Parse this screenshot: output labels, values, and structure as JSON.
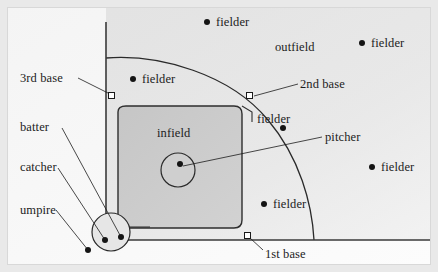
{
  "figure": {
    "background_color": "#fbfbfb",
    "frame_color": "#e9e9e9",
    "ink_color": "#1c1c1c",
    "outfield_fill": "#d9d9d9",
    "infield_fill": "#c9c9c9"
  },
  "region_labels": {
    "outfield": "outfield",
    "infield": "infield"
  },
  "base_labels": {
    "first": "1st base",
    "second": "2nd base",
    "third": "3rd base"
  },
  "player_labels": {
    "pitcher": "pitcher",
    "batter": "batter",
    "catcher": "catcher",
    "umpire": "umpire"
  },
  "fielders": [
    {
      "label": "fielder",
      "dot_x": 207,
      "dot_y": 22,
      "text_x": 216,
      "text_y": 15
    },
    {
      "label": "fielder",
      "dot_x": 362,
      "dot_y": 43,
      "text_x": 371,
      "text_y": 36
    },
    {
      "label": "fielder",
      "dot_x": 133,
      "dot_y": 79,
      "text_x": 142,
      "text_y": 72
    },
    {
      "label": "fielder",
      "dot_x": 283,
      "dot_y": 128,
      "text_x": 257,
      "text_y": 112
    },
    {
      "label": "fielder",
      "dot_x": 372,
      "dot_y": 167,
      "text_x": 381,
      "text_y": 160
    },
    {
      "label": "fielder",
      "dot_x": 264,
      "dot_y": 204,
      "text_x": 273,
      "text_y": 197
    }
  ],
  "bases": [
    {
      "name": "third",
      "x": 112,
      "y": 93
    },
    {
      "name": "second",
      "x": 249,
      "y": 93
    },
    {
      "name": "first",
      "x": 247,
      "y": 233
    }
  ],
  "home_plate": {
    "circle_center_x": 111,
    "circle_center_y": 232,
    "circle_radius": 19,
    "batter_dot_x": 121,
    "batter_dot_y": 237,
    "catcher_dot_x": 105,
    "catcher_dot_y": 240,
    "umpire_dot_x": 88,
    "umpire_dot_y": 250
  },
  "pitcher_mound": {
    "circle_center_x": 178,
    "circle_center_y": 170,
    "circle_radius": 17,
    "dot_x": 180,
    "dot_y": 164
  },
  "label_positions": {
    "third_base": {
      "x": 20,
      "y": 71
    },
    "second_base": {
      "x": 300,
      "y": 77
    },
    "first_base": {
      "x": 265,
      "y": 247
    },
    "pitcher": {
      "x": 325,
      "y": 130
    },
    "batter": {
      "x": 20,
      "y": 120
    },
    "catcher": {
      "x": 20,
      "y": 160
    },
    "umpire": {
      "x": 20,
      "y": 203
    },
    "outfield": {
      "x": 275,
      "y": 40
    },
    "infield": {
      "x": 157,
      "y": 126
    }
  }
}
